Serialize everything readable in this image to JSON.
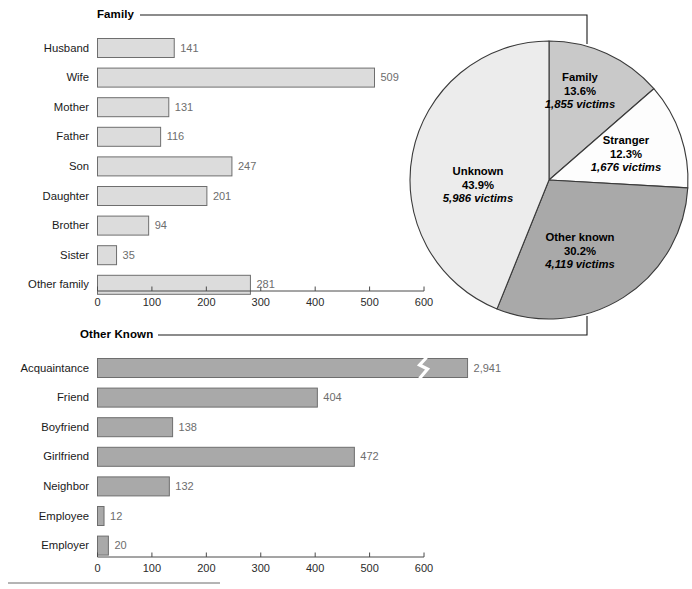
{
  "figure": {
    "bottom_rule": true
  },
  "chart_data": [
    {
      "type": "bar",
      "title": "Family",
      "orientation": "horizontal",
      "categories": [
        "Husband",
        "Wife",
        "Mother",
        "Father",
        "Son",
        "Daughter",
        "Brother",
        "Sister",
        "Other family"
      ],
      "values": [
        141,
        509,
        131,
        116,
        247,
        201,
        94,
        35,
        281
      ],
      "value_labels": [
        "141",
        "509",
        "131",
        "116",
        "247",
        "201",
        "94",
        "35",
        "281"
      ],
      "xlabel": "",
      "ylabel": "",
      "xlim": [
        0,
        600
      ],
      "xticks": [
        0,
        100,
        200,
        300,
        400,
        500,
        600
      ],
      "xtick_labels": [
        "0",
        "100",
        "200",
        "300",
        "400",
        "500",
        "600"
      ],
      "grid": false,
      "bar_color": "#dcdcdc",
      "bar_edge": "#6e6e6e"
    },
    {
      "type": "bar",
      "title": "Other Known",
      "orientation": "horizontal",
      "categories": [
        "Acquaintance",
        "Friend",
        "Boyfriend",
        "Girlfriend",
        "Neighbor",
        "Employee",
        "Employer"
      ],
      "values": [
        2941,
        404,
        138,
        472,
        132,
        12,
        20
      ],
      "value_labels": [
        "2,941",
        "404",
        "138",
        "472",
        "132",
        "12",
        "20"
      ],
      "broken_axis_bars": [
        "Acquaintance"
      ],
      "xlabel": "",
      "ylabel": "",
      "xlim": [
        0,
        600
      ],
      "xticks": [
        0,
        100,
        200,
        300,
        400,
        500,
        600
      ],
      "xtick_labels": [
        "0",
        "100",
        "200",
        "300",
        "400",
        "500",
        "600"
      ],
      "grid": false,
      "bar_color": "#a9a9a9",
      "bar_edge": "#6e6e6e"
    },
    {
      "type": "pie",
      "title": "",
      "slices": [
        {
          "name": "Family",
          "percent": 13.6,
          "percent_label": "13.6%",
          "victims": 1855,
          "victims_label": "1,855 victims",
          "color": "#c9c9c9"
        },
        {
          "name": "Stranger",
          "percent": 12.3,
          "percent_label": "12.3%",
          "victims": 1676,
          "victims_label": "1,676 victims",
          "color": "#fdfdfd"
        },
        {
          "name": "Other known",
          "percent": 30.2,
          "percent_label": "30.2%",
          "victims": 4119,
          "victims_label": "4,119 victims",
          "color": "#a9a9a9"
        },
        {
          "name": "Unknown",
          "percent": 43.9,
          "percent_label": "43.9%",
          "victims": 5986,
          "victims_label": "5,986 victims",
          "color": "#ececec"
        }
      ],
      "legend_position": "inside-slices",
      "start_angle_deg": 0,
      "direction": "clockwise"
    }
  ]
}
